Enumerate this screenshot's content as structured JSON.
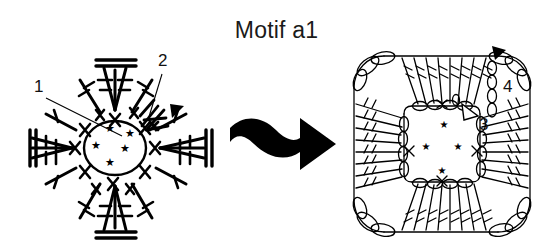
{
  "figure": {
    "title": "Motif a1",
    "background_color": "#ffffff",
    "ink_color": "#000000",
    "type": "crochet-stitch-chart-diagram",
    "panel_count": 2
  },
  "transition_arrow": {
    "icon": "wavy-right-arrow-icon",
    "direction": "right",
    "color": "#000000",
    "style": "thick-solid-squiggle"
  },
  "left_diagram": {
    "name": "round-motif-chart",
    "shape": "star-burst-round",
    "center_ring": {
      "symbol": "magic-ring-circle",
      "star_count": 5,
      "star_glyph": "★"
    },
    "callouts": [
      {
        "id": "1",
        "label": "1",
        "leader": "line-to-center-ring"
      },
      {
        "id": "2",
        "label": "2",
        "leader": "line-to-upper-right-cluster"
      }
    ],
    "markers": [
      {
        "icon": "filled-triangle-marker-icon",
        "label": "",
        "color": "#000000",
        "position": "upper-right"
      }
    ],
    "stitch_symbols": [
      "treble-crochet",
      "double-treble-crochet",
      "single-crochet-x",
      "chain",
      "star"
    ]
  },
  "right_diagram": {
    "name": "square-motif-chart",
    "shape": "rounded-square",
    "inner_ring": {
      "symbol": "chain-loop-square",
      "star_count": 4,
      "star_glyph": "★"
    },
    "callouts": [
      {
        "id": "3",
        "label": "3",
        "marker": "hollow-triangle-marker-icon"
      },
      {
        "id": "4",
        "label": "4",
        "marker": "filled-triangle-marker-icon"
      }
    ],
    "markers": [
      {
        "icon": "filled-triangle-marker-icon",
        "label": "",
        "color": "#000000",
        "position": "top-right-corner"
      },
      {
        "icon": "hollow-triangle-marker-icon",
        "label": "",
        "color": "#ffffff",
        "position": "inner-right"
      }
    ],
    "stitch_symbols": [
      "treble-crochet",
      "chain",
      "single-crochet-x",
      "star"
    ]
  }
}
